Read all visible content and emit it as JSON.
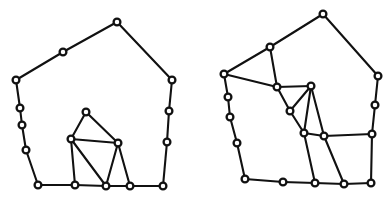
{
  "document": {
    "title": "Polygon Mesh Figures",
    "background_color": "#ffffff",
    "stroke_color": "#111111",
    "vertex_fill_color": "#ffffff",
    "width": 392,
    "height": 201,
    "caption": ""
  },
  "figures": [
    {
      "id": "figure-left",
      "name": "left-polygon-figure",
      "label": "",
      "vertices": [
        {
          "id": "L0",
          "name": "outer-apex",
          "x": 117,
          "y": 22
        },
        {
          "id": "L1",
          "name": "outer-upper-right",
          "x": 172,
          "y": 80
        },
        {
          "id": "L2",
          "name": "outer-right-1",
          "x": 169,
          "y": 111
        },
        {
          "id": "L3",
          "name": "outer-right-2",
          "x": 167,
          "y": 142
        },
        {
          "id": "L4",
          "name": "outer-bottom-right",
          "x": 163,
          "y": 186
        },
        {
          "id": "L5",
          "name": "outer-bottom-4",
          "x": 130,
          "y": 186
        },
        {
          "id": "L6",
          "name": "outer-bottom-3",
          "x": 106,
          "y": 186
        },
        {
          "id": "L7",
          "name": "outer-bottom-2",
          "x": 75,
          "y": 185
        },
        {
          "id": "L8",
          "name": "outer-bottom-left",
          "x": 38,
          "y": 185
        },
        {
          "id": "L9",
          "name": "outer-left-4",
          "x": 26,
          "y": 150
        },
        {
          "id": "L10",
          "name": "outer-left-3",
          "x": 22,
          "y": 125
        },
        {
          "id": "L11",
          "name": "outer-left-2",
          "x": 20,
          "y": 108
        },
        {
          "id": "L12",
          "name": "outer-upper-left",
          "x": 16,
          "y": 80
        },
        {
          "id": "L13",
          "name": "outer-upper-mid-left",
          "x": 63,
          "y": 52
        },
        {
          "id": "L14",
          "name": "inner-peak",
          "x": 86,
          "y": 112
        },
        {
          "id": "L15",
          "name": "inner-left",
          "x": 71,
          "y": 139
        },
        {
          "id": "L16",
          "name": "inner-right",
          "x": 118,
          "y": 143
        }
      ],
      "edges": [
        [
          "L0",
          "L13"
        ],
        [
          "L13",
          "L12"
        ],
        [
          "L12",
          "L11"
        ],
        [
          "L11",
          "L10"
        ],
        [
          "L10",
          "L9"
        ],
        [
          "L9",
          "L8"
        ],
        [
          "L8",
          "L7"
        ],
        [
          "L7",
          "L6"
        ],
        [
          "L6",
          "L5"
        ],
        [
          "L5",
          "L4"
        ],
        [
          "L4",
          "L3"
        ],
        [
          "L3",
          "L2"
        ],
        [
          "L2",
          "L1"
        ],
        [
          "L1",
          "L0"
        ],
        [
          "L14",
          "L15"
        ],
        [
          "L14",
          "L16"
        ],
        [
          "L15",
          "L16"
        ],
        [
          "L15",
          "L7"
        ],
        [
          "L15",
          "L6"
        ],
        [
          "L16",
          "L6"
        ],
        [
          "L16",
          "L5"
        ]
      ]
    },
    {
      "id": "figure-right",
      "name": "right-polygon-figure",
      "label": "",
      "vertices": [
        {
          "id": "R0",
          "name": "outer-apex",
          "x": 323,
          "y": 14
        },
        {
          "id": "R1",
          "name": "outer-upper-right",
          "x": 378,
          "y": 76
        },
        {
          "id": "R2",
          "name": "outer-right-1",
          "x": 375,
          "y": 105
        },
        {
          "id": "R3",
          "name": "outer-right-2",
          "x": 372,
          "y": 134
        },
        {
          "id": "R4",
          "name": "outer-bottom-right",
          "x": 371,
          "y": 183
        },
        {
          "id": "R5",
          "name": "outer-bottom-4",
          "x": 344,
          "y": 184
        },
        {
          "id": "R6",
          "name": "outer-bottom-3",
          "x": 315,
          "y": 183
        },
        {
          "id": "R7",
          "name": "outer-bottom-2",
          "x": 283,
          "y": 182
        },
        {
          "id": "R8",
          "name": "outer-bottom-left",
          "x": 245,
          "y": 179
        },
        {
          "id": "R9",
          "name": "outer-left-4",
          "x": 237,
          "y": 143
        },
        {
          "id": "R10",
          "name": "outer-left-3",
          "x": 230,
          "y": 117
        },
        {
          "id": "R11",
          "name": "outer-left-2",
          "x": 228,
          "y": 97
        },
        {
          "id": "R12",
          "name": "outer-upper-left",
          "x": 224,
          "y": 74
        },
        {
          "id": "R13",
          "name": "outer-upper-mid-left",
          "x": 270,
          "y": 47
        },
        {
          "id": "R14",
          "name": "inner-upper-left",
          "x": 277,
          "y": 87
        },
        {
          "id": "R15",
          "name": "inner-upper-right",
          "x": 311,
          "y": 86
        },
        {
          "id": "R16",
          "name": "inner-mid-left",
          "x": 290,
          "y": 111
        },
        {
          "id": "R17",
          "name": "inner-lower-left",
          "x": 304,
          "y": 133
        },
        {
          "id": "R18",
          "name": "inner-lower-right",
          "x": 324,
          "y": 136
        }
      ],
      "edges": [
        [
          "R0",
          "R13"
        ],
        [
          "R13",
          "R12"
        ],
        [
          "R12",
          "R11"
        ],
        [
          "R11",
          "R10"
        ],
        [
          "R10",
          "R9"
        ],
        [
          "R9",
          "R8"
        ],
        [
          "R8",
          "R7"
        ],
        [
          "R7",
          "R6"
        ],
        [
          "R6",
          "R5"
        ],
        [
          "R5",
          "R4"
        ],
        [
          "R4",
          "R3"
        ],
        [
          "R3",
          "R2"
        ],
        [
          "R2",
          "R1"
        ],
        [
          "R1",
          "R0"
        ],
        [
          "R13",
          "R14"
        ],
        [
          "R12",
          "R14"
        ],
        [
          "R14",
          "R15"
        ],
        [
          "R14",
          "R16"
        ],
        [
          "R16",
          "R15"
        ],
        [
          "R16",
          "R17"
        ],
        [
          "R15",
          "R17"
        ],
        [
          "R15",
          "R18"
        ],
        [
          "R17",
          "R18"
        ],
        [
          "R18",
          "R3"
        ],
        [
          "R18",
          "R5"
        ],
        [
          "R17",
          "R6"
        ]
      ]
    }
  ]
}
